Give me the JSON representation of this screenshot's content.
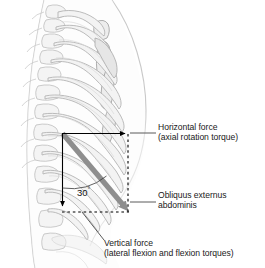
{
  "figure": {
    "background_color": "#ffffff"
  },
  "labels": {
    "horizontal_force": {
      "line1": "Horizontal force",
      "line2": "(axial rotation torque)"
    },
    "obliquus": {
      "line1": "Obliquus externus",
      "line2": "abdominis"
    },
    "vertical_force": {
      "line1": "Vertical force",
      "line2": "(lateral flexion and flexion torques)"
    }
  },
  "angle": {
    "value": "30",
    "degree_symbol": "°"
  },
  "colors": {
    "muscle_vector": "#8e8e8e",
    "force_line": "#000000",
    "dashed_line": "#000000",
    "leader_line": "#5a5a5a",
    "text": "#1a1a1a",
    "bone_fill": "#f2f2f2",
    "bone_stroke": "#b5b5b5",
    "body_outline": "#c9c9c9",
    "shadow": "#dcdcdc"
  },
  "geometry": {
    "origin_x": 62,
    "origin_y": 133,
    "horizontal_end_x": 128,
    "vertical_end_y": 212,
    "muscle_end_x": 128,
    "muscle_end_y": 210
  }
}
